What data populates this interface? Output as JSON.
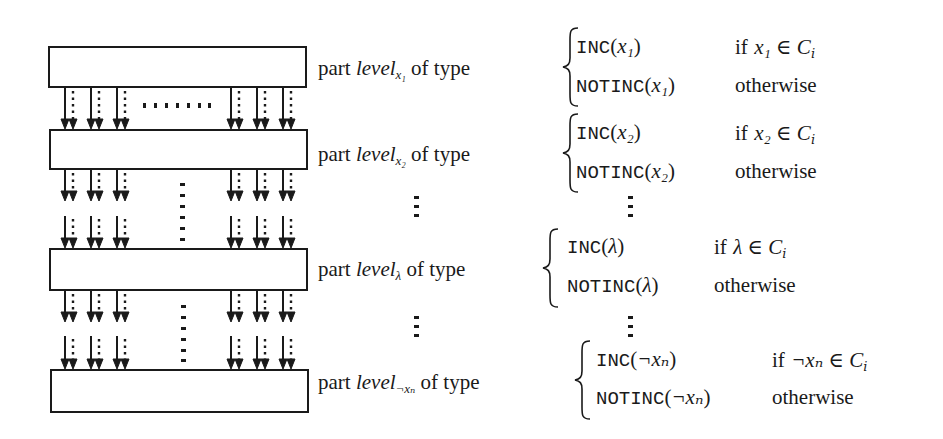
{
  "diagram": {
    "boxes": [
      {
        "id": "box-1",
        "x": 48,
        "y": 46,
        "w": 259,
        "h": 42
      },
      {
        "id": "box-2",
        "x": 49,
        "y": 129,
        "w": 259,
        "h": 41
      },
      {
        "id": "box-3",
        "x": 49,
        "y": 248,
        "w": 259,
        "h": 43
      },
      {
        "id": "box-4",
        "x": 50,
        "y": 369,
        "w": 259,
        "h": 44
      }
    ],
    "arrow_columns_x": [
      65,
      91,
      117,
      231,
      257,
      283
    ],
    "arrow_segments": [
      {
        "y1": 88,
        "y2": 129
      },
      {
        "y1": 170,
        "y2": 201
      },
      {
        "y1": 216,
        "y2": 248
      },
      {
        "y1": 291,
        "y2": 322
      },
      {
        "y1": 336,
        "y2": 369
      }
    ],
    "levels": [
      {
        "prefix": "part",
        "name": "level",
        "subscript": "x1",
        "subscript_display": "x₁",
        "suffix": "of type",
        "case_true": {
          "fn": "INC",
          "arg": "x₁",
          "condition_prefix": "if",
          "condition": "x₁ ∈ C",
          "condition_sub": "i"
        },
        "case_false": {
          "fn": "NOTINC",
          "arg": "x₁",
          "condition": "otherwise"
        }
      },
      {
        "prefix": "part",
        "name": "level",
        "subscript": "x2",
        "subscript_display": "x₂",
        "suffix": "of type",
        "case_true": {
          "fn": "INC",
          "arg": "x₂",
          "condition_prefix": "if",
          "condition": "x₂ ∈ C",
          "condition_sub": "i"
        },
        "case_false": {
          "fn": "NOTINC",
          "arg": "x₂",
          "condition": "otherwise"
        }
      },
      {
        "prefix": "part",
        "name": "level",
        "subscript": "lambda",
        "subscript_display": "λ",
        "suffix": "of type",
        "case_true": {
          "fn": "INC",
          "arg": "λ",
          "condition_prefix": "if",
          "condition": "λ ∈ C",
          "condition_sub": "i"
        },
        "case_false": {
          "fn": "NOTINC",
          "arg": "λ",
          "condition": "otherwise"
        }
      },
      {
        "prefix": "part",
        "name": "level",
        "subscript": "not xn",
        "subscript_display": "¬xₙ",
        "suffix": "of type",
        "case_true": {
          "fn": "INC",
          "arg": "¬xₙ",
          "condition_prefix": "if",
          "condition": "¬xₙ ∈ C",
          "condition_sub": "i"
        },
        "case_false": {
          "fn": "NOTINC",
          "arg": "¬xₙ",
          "condition": "otherwise"
        }
      }
    ],
    "ellipsis": {
      "horizontal": "……",
      "vertical": "⋮"
    },
    "colors": {
      "stroke": "#1a1a1a",
      "background": "#ffffff"
    }
  }
}
